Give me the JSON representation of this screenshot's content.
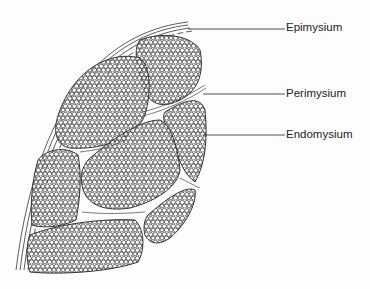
{
  "diagram": {
    "labels": [
      {
        "id": "epimysium",
        "text": "Epimysium",
        "x": 286,
        "y": 22,
        "line_from": [
          188,
          29
        ],
        "line_to": [
          285,
          29
        ]
      },
      {
        "id": "perimysium",
        "text": "Perimysium",
        "x": 286,
        "y": 88,
        "line_from": [
          203,
          94
        ],
        "line_to": [
          285,
          94
        ]
      },
      {
        "id": "endomysium",
        "text": "Endomysium",
        "x": 286,
        "y": 129,
        "line_from": [
          203,
          135
        ],
        "line_to": [
          285,
          135
        ]
      }
    ],
    "colors": {
      "ink": "#2a2a2a",
      "background": "#fdfdfd"
    }
  }
}
